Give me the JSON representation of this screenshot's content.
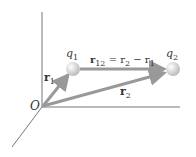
{
  "diagram": {
    "origin_label": "O",
    "charges": [
      {
        "label": "q",
        "sub": "1"
      },
      {
        "label": "q",
        "sub": "2"
      }
    ],
    "vectors": {
      "r1": {
        "label": "r",
        "sub": "1"
      },
      "r2": {
        "label": "r",
        "sub": "2"
      },
      "r12": {
        "label": "r",
        "sub": "12",
        "eq": " = r",
        "eq_sub": "2",
        "minus": " − r",
        "minus_sub": "1"
      }
    },
    "colors": {
      "axis": "#777777",
      "arrow": "#999999",
      "sphere": "#dcdcdc",
      "text": "#333333"
    }
  }
}
